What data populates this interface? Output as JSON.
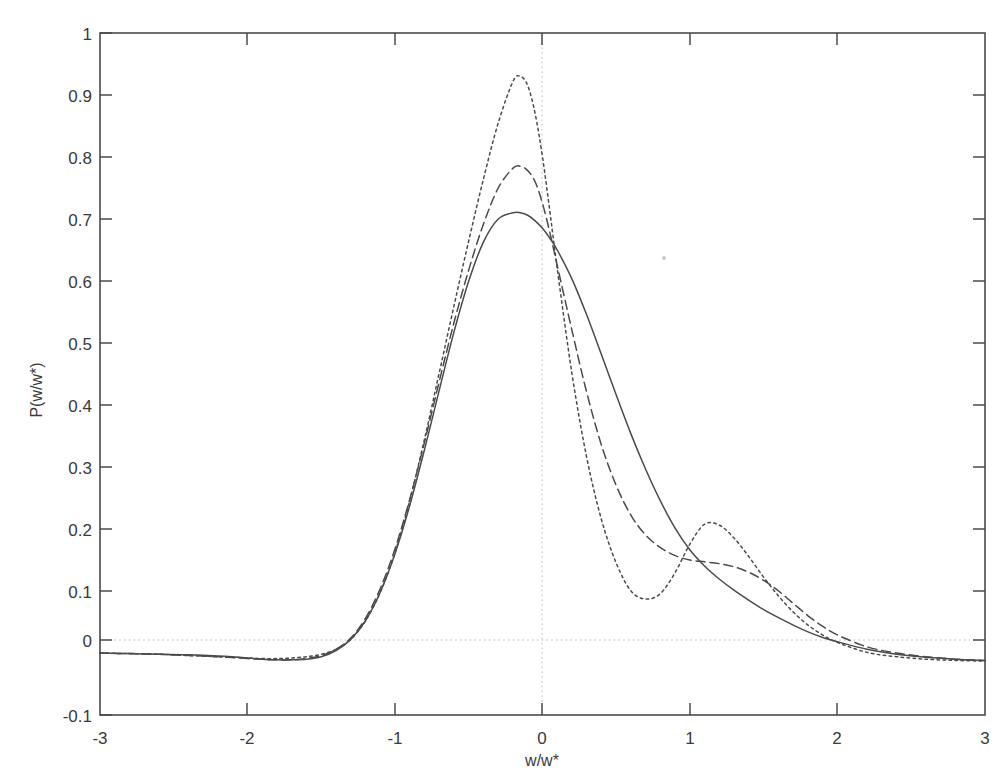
{
  "figure": {
    "background_color": "#ffffff",
    "curve_color": "#4b4b4b",
    "grid_color": "#b9b9b9",
    "axis_color": "#4a4a4a"
  },
  "axes": {
    "x_label": "w/w*",
    "y_label": "P(w/w*)",
    "x_ticks": [
      "-3",
      "-2",
      "-1",
      "0",
      "1",
      "2",
      "3"
    ],
    "y_ticks": [
      "1",
      "0.9",
      "0.8",
      "0.7",
      "0.6",
      "0.5",
      "0.4",
      "0.3",
      "0.2",
      "0.1",
      "0",
      "-0.1"
    ]
  },
  "chart_data": {
    "type": "line",
    "title": "",
    "subtitle": "",
    "xlabel": "w/w*",
    "ylabel": "P(w/w*)",
    "xlim": [
      -3,
      3
    ],
    "ylim": [
      -0.1,
      1
    ],
    "xticks": [
      -3,
      -2,
      -1,
      0,
      1,
      2,
      3
    ],
    "yticks": [
      1,
      0.9,
      0.8,
      0.7,
      0.6,
      0.5,
      0.4,
      0.3,
      0.2,
      0.1,
      0,
      -0.1
    ],
    "grid": "dotted gridlines at x=0 and y=0 only",
    "legend": "none",
    "annotations": [],
    "x": [
      -3.0,
      -2.8,
      -2.6,
      -2.4,
      -2.2,
      -2.0,
      -1.9,
      -1.8,
      -1.7,
      -1.6,
      -1.5,
      -1.4,
      -1.3,
      -1.2,
      -1.1,
      -1.0,
      -0.9,
      -0.8,
      -0.7,
      -0.6,
      -0.5,
      -0.4,
      -0.3,
      -0.2,
      -0.15,
      -0.1,
      -0.05,
      0.0,
      0.05,
      0.1,
      0.2,
      0.3,
      0.4,
      0.5,
      0.6,
      0.7,
      0.8,
      0.9,
      1.0,
      1.1,
      1.2,
      1.3,
      1.4,
      1.5,
      1.6,
      1.7,
      1.8,
      1.9,
      2.0,
      2.2,
      2.4,
      2.6,
      2.8,
      3.0
    ],
    "series": [
      {
        "name": "solid",
        "style": "solid",
        "peak_value": 0.71,
        "peak_x": -0.15,
        "values": [
          0.0,
          -0.001,
          -0.002,
          -0.003,
          -0.005,
          -0.008,
          -0.01,
          -0.011,
          -0.011,
          -0.01,
          -0.006,
          0.004,
          0.022,
          0.052,
          0.098,
          0.16,
          0.238,
          0.328,
          0.424,
          0.518,
          0.6,
          0.663,
          0.7,
          0.71,
          0.71,
          0.706,
          0.697,
          0.685,
          0.669,
          0.65,
          0.603,
          0.545,
          0.481,
          0.416,
          0.353,
          0.296,
          0.245,
          0.201,
          0.166,
          0.14,
          0.119,
          0.101,
          0.085,
          0.07,
          0.057,
          0.045,
          0.034,
          0.025,
          0.018,
          0.006,
          -0.002,
          -0.007,
          -0.01,
          -0.012
        ]
      },
      {
        "name": "dashed",
        "style": "dashed",
        "peak_value": 0.785,
        "peak_x": -0.15,
        "values": [
          0.0,
          -0.001,
          -0.002,
          -0.004,
          -0.006,
          -0.009,
          -0.01,
          -0.011,
          -0.011,
          -0.009,
          -0.004,
          0.006,
          0.024,
          0.056,
          0.104,
          0.168,
          0.248,
          0.34,
          0.438,
          0.533,
          0.618,
          0.692,
          0.75,
          0.782,
          0.785,
          0.778,
          0.76,
          0.725,
          0.678,
          0.625,
          0.52,
          0.42,
          0.335,
          0.27,
          0.222,
          0.19,
          0.17,
          0.157,
          0.15,
          0.147,
          0.144,
          0.139,
          0.13,
          0.117,
          0.1,
          0.08,
          0.06,
          0.043,
          0.029,
          0.01,
          0.0,
          -0.006,
          -0.01,
          -0.012
        ]
      },
      {
        "name": "dotted",
        "style": "dotted",
        "peak_value": 0.93,
        "peak_x": -0.15,
        "secondary_peak_value": 0.21,
        "secondary_peak_x": 1.1,
        "local_min_value": 0.087,
        "local_min_x": 0.62,
        "values": [
          0.0,
          -0.001,
          -0.002,
          -0.004,
          -0.006,
          -0.008,
          -0.009,
          -0.009,
          -0.008,
          -0.006,
          -0.002,
          0.006,
          0.022,
          0.052,
          0.098,
          0.162,
          0.246,
          0.345,
          0.452,
          0.56,
          0.665,
          0.765,
          0.855,
          0.922,
          0.93,
          0.915,
          0.87,
          0.8,
          0.712,
          0.62,
          0.45,
          0.315,
          0.215,
          0.145,
          0.1,
          0.087,
          0.096,
          0.13,
          0.176,
          0.208,
          0.206,
          0.185,
          0.155,
          0.122,
          0.092,
          0.066,
          0.045,
          0.029,
          0.017,
          0.001,
          -0.006,
          -0.01,
          -0.012,
          -0.013
        ]
      }
    ]
  }
}
